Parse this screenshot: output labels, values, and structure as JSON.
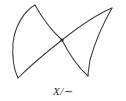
{
  "figure": {
    "name": "quotient-space-diagram",
    "caption": {
      "full": "X/~",
      "variable": "X",
      "separator": "/",
      "relation": "∼"
    },
    "background_color": "#ffffff",
    "stroke_color": "#3a3a3a",
    "node_color": "#2b2b2b",
    "canvas": {
      "width": 126,
      "height": 101
    },
    "labeled_points": [
      {
        "name": "top-left-cusp",
        "x": 35,
        "y": 5
      },
      {
        "name": "bottom-left-cusp",
        "x": 18,
        "y": 78
      },
      {
        "name": "crossing-node",
        "x": 62,
        "y": 40
      },
      {
        "name": "top-right-cusp",
        "x": 112,
        "y": 8
      },
      {
        "name": "bottom-right-cusp",
        "x": 88,
        "y": 76
      }
    ],
    "paths": {
      "left_lobe_outer": "M 35 5 C 24 11, 15 26, 13 43 C 12 58, 14 70, 18 78",
      "left_lobe_inner": "M 35 5 C 41 16, 50 29, 62 40",
      "left_lobe_lower": "M 18 78 C 30 66, 48 51, 62 40",
      "right_lobe_upper": "M 62 40 C 76 29, 95 15, 112 8",
      "right_lobe_outer": "M 112 8 C 104 22, 95 42, 90 60 C 89 67, 88 73, 88 76",
      "right_lobe_lower": "M 62 40 C 69 54, 79 68, 88 76"
    }
  }
}
